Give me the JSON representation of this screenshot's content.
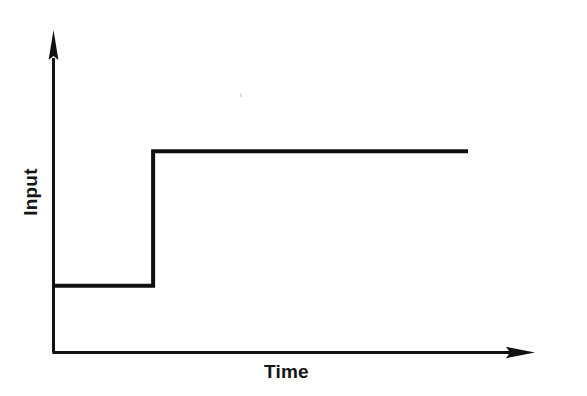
{
  "figure": {
    "background_color": "#ffffff",
    "line_color": "#111111",
    "axis_color": "#111111"
  },
  "chart_data": {
    "type": "line",
    "title": "",
    "subtitle": "",
    "xlabel": "Time",
    "ylabel": "Input",
    "grid": false,
    "legend": null,
    "axis_style": "arrow-headed open axes (no ticks, no tick labels)",
    "xticks": [],
    "yticks": [],
    "xlim": [
      0,
      1
    ],
    "ylim": [
      0,
      1
    ],
    "series": [
      {
        "name": "Input step",
        "shape": "step",
        "color": "#111111",
        "line_width": 4,
        "x": [
          0.0,
          0.243,
          0.243,
          1.0
        ],
        "y": [
          0.228,
          0.228,
          0.688,
          0.688
        ],
        "annotation": "constant low level, instantaneous step up, then constant high level"
      }
    ]
  },
  "labels": {
    "x_axis": "Time",
    "y_axis": "Input"
  },
  "icons": {
    "x_axis_arrow": "arrow-right-icon",
    "y_axis_arrow": "arrow-up-icon"
  }
}
